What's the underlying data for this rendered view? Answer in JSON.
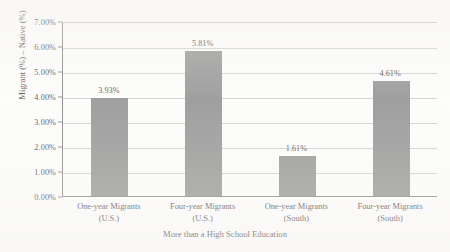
{
  "chart_data": {
    "type": "bar",
    "title": "",
    "subtitle": "",
    "xlabel": "More than a High School Education",
    "ylabel": "Migrant (%) – Native (%)",
    "categories": [
      "One-year Migrants (U.S.)",
      "Four-year Migrants (U.S.)",
      "One-year Migrants (South)",
      "Four-year Migrants (South)"
    ],
    "category_lines": [
      [
        "One-year Migrants",
        "(U.S.)"
      ],
      [
        "Four-year Migrants",
        "(U.S.)"
      ],
      [
        "One-year Migrants",
        "(South)"
      ],
      [
        "Four-year Migrants",
        "(South)"
      ]
    ],
    "values": [
      3.93,
      5.81,
      1.61,
      4.61
    ],
    "value_labels": [
      "3.93%",
      "5.81%",
      "1.61%",
      "4.61%"
    ],
    "ylim": [
      0,
      7
    ],
    "ytick_step": 1,
    "ytick_labels": [
      "0.00%",
      "1.00%",
      "2.00%",
      "3.00%",
      "4.00%",
      "5.00%",
      "6.00%",
      "7.00%"
    ],
    "ytick_values": [
      0,
      1,
      2,
      3,
      4,
      5,
      6,
      7
    ],
    "grid": true,
    "grid_axis": "y",
    "legend": false,
    "legend_position": "none",
    "bar_color": "#808080",
    "gridline_color": "#c9c9c9",
    "axis_color": "#6e6e6e",
    "background_color": "#fdfdfc"
  }
}
